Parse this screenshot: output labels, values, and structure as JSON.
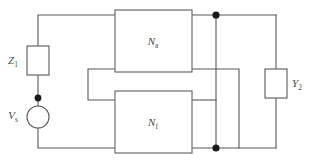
{
  "figure": {
    "name": "feedback-amplifier-circuit",
    "background_color": "#ffffff",
    "wire_color": "#58585a",
    "label_color": "#4a4a4c",
    "junction_color": "#1a1a1a"
  },
  "components": {
    "source": {
      "label_main": "V",
      "label_sub": "s",
      "type": "circle-source"
    },
    "input_impedance": {
      "label_main": "Z",
      "label_sub": "1",
      "type": "rectangle-box"
    },
    "output_admittance": {
      "label_main": "Y",
      "label_sub": "2",
      "type": "rectangle-box"
    },
    "amplifier_network": {
      "label_main": "N",
      "label_sub": "a",
      "type": "two-port-block"
    },
    "feedback_network": {
      "label_main": "N",
      "label_sub": "f",
      "type": "two-port-block"
    }
  },
  "junctions": [
    {
      "name": "source-top-node"
    },
    {
      "name": "amplifier-output-node"
    },
    {
      "name": "bottom-rail-node"
    }
  ]
}
